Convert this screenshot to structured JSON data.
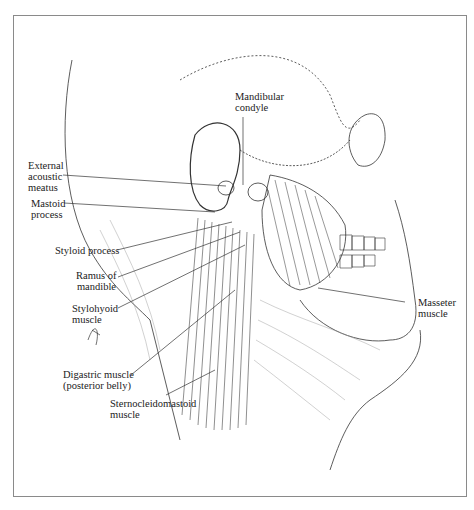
{
  "figure": {
    "type": "anatomical-illustration"
  },
  "labels": [
    {
      "id": "mandibular-condyle",
      "lines": [
        "Mandibular",
        "condyle"
      ]
    },
    {
      "id": "external-acoustic-meatus",
      "lines": [
        "External",
        "acoustic",
        "meatus"
      ]
    },
    {
      "id": "mastoid-process",
      "lines": [
        "Mastoid",
        "process"
      ]
    },
    {
      "id": "styloid-process",
      "lines": [
        "Styloid process"
      ]
    },
    {
      "id": "ramus-of-mandible",
      "lines": [
        "Ramus of",
        "mandible"
      ]
    },
    {
      "id": "stylohyoid-muscle",
      "lines": [
        "Stylohyoid",
        "muscle"
      ]
    },
    {
      "id": "digastric-muscle",
      "lines": [
        "Digastric muscle",
        "(posterior belly)"
      ]
    },
    {
      "id": "sternocleidomastoid-muscle",
      "lines": [
        "Sternocleidomastoid",
        "muscle"
      ]
    },
    {
      "id": "masseter-muscle",
      "lines": [
        "Masseter",
        "muscle"
      ]
    }
  ],
  "colors": {
    "ink": "#222222",
    "frame": "#8a8a8a",
    "background": "#ffffff"
  }
}
